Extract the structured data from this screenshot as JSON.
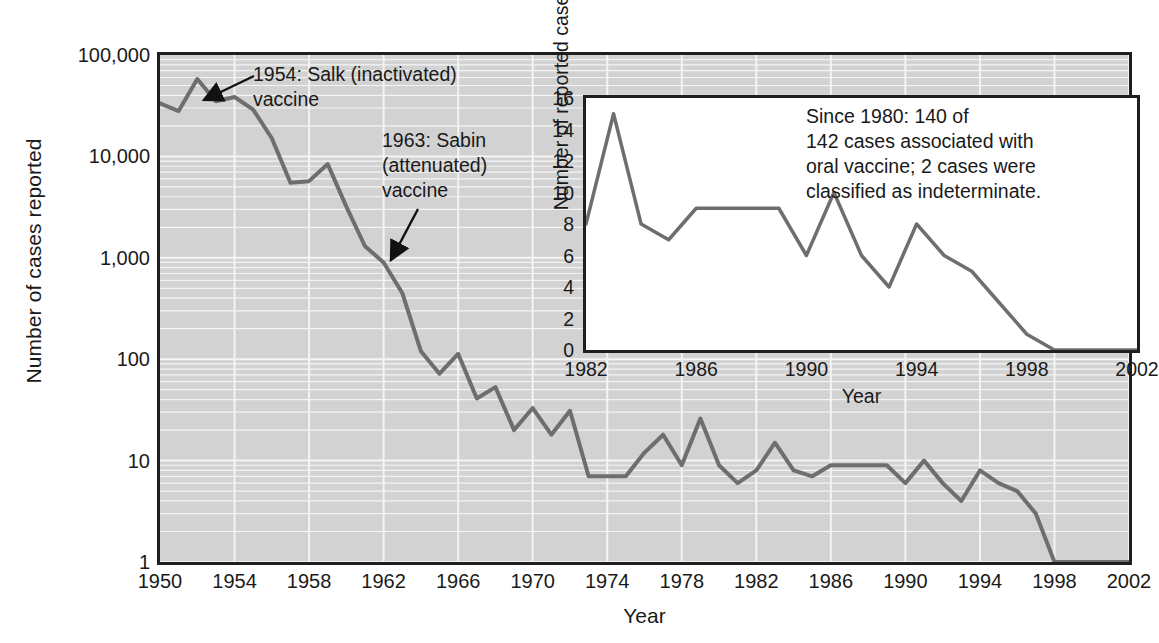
{
  "chart_data": [
    {
      "type": "line",
      "name": "main-chart",
      "title": "",
      "xlabel": "Year",
      "ylabel": "Number of cases reported",
      "yscale": "log",
      "ylim": [
        1,
        100000
      ],
      "xlim": [
        1950,
        2002
      ],
      "ytick_labels": [
        "1",
        "10",
        "100",
        "1,000",
        "10,000",
        "100,000"
      ],
      "ytick_values": [
        1,
        10,
        100,
        1000,
        10000,
        100000
      ],
      "xtick_labels": [
        "1950",
        "1954",
        "1958",
        "1962",
        "1966",
        "1970",
        "1974",
        "1978",
        "1982",
        "1986",
        "1990",
        "1994",
        "1998",
        "2002"
      ],
      "xtick_values": [
        1950,
        1954,
        1958,
        1962,
        1966,
        1970,
        1974,
        1978,
        1982,
        1986,
        1990,
        1994,
        1998,
        2002
      ],
      "grid": true,
      "legend": "none",
      "line_color": "#6e6e6e",
      "plot_background": "#d2d2d2",
      "x": [
        1950,
        1951,
        1952,
        1953,
        1954,
        1955,
        1956,
        1957,
        1958,
        1959,
        1960,
        1961,
        1962,
        1963,
        1964,
        1965,
        1966,
        1967,
        1968,
        1969,
        1970,
        1971,
        1972,
        1973,
        1974,
        1975,
        1976,
        1977,
        1978,
        1979,
        1980,
        1981,
        1982,
        1983,
        1984,
        1985,
        1986,
        1987,
        1988,
        1989,
        1990,
        1991,
        1992,
        1993,
        1994,
        1995,
        1996,
        1997,
        1998,
        1999,
        2000,
        2001,
        2002
      ],
      "y": [
        33300,
        28000,
        58000,
        35000,
        38500,
        28900,
        15100,
        5500,
        5700,
        8400,
        3200,
        1300,
        900,
        450,
        120,
        72,
        113,
        41,
        53,
        20,
        33,
        18,
        31,
        7,
        7,
        7,
        12,
        18,
        9,
        26,
        9,
        6,
        8,
        15,
        8,
        7,
        9,
        9,
        9,
        9,
        6,
        10,
        6,
        4,
        8,
        6,
        5,
        3,
        1,
        1,
        1,
        1,
        1
      ],
      "annotations": [
        {
          "name": "salk-annotation",
          "text": "1954: Salk (inactivated)\nvaccine",
          "points_to_year": 1955
        },
        {
          "name": "sabin-annotation",
          "text": "1963: Sabin\n(attenuated)\nvaccine",
          "points_to_year": 1963
        }
      ]
    },
    {
      "type": "line",
      "name": "inset-chart",
      "title": "",
      "xlabel": "Year",
      "ylabel": "Number of reported cases",
      "yscale": "linear",
      "ylim": [
        0,
        16
      ],
      "xlim": [
        1982,
        2002
      ],
      "ytick_labels": [
        "0",
        "2",
        "4",
        "6",
        "8",
        "10",
        "12",
        "14",
        "16"
      ],
      "ytick_values": [
        0,
        2,
        4,
        6,
        8,
        10,
        12,
        14,
        16
      ],
      "xtick_labels": [
        "1982",
        "1986",
        "1990",
        "1994",
        "1998",
        "2002"
      ],
      "xtick_values": [
        1982,
        1986,
        1990,
        1994,
        1998,
        2002
      ],
      "grid": false,
      "legend": "none",
      "line_color": "#6e6e6e",
      "plot_background": "#ffffff",
      "x": [
        1982,
        1983,
        1984,
        1985,
        1986,
        1987,
        1988,
        1989,
        1990,
        1991,
        1992,
        1993,
        1994,
        1995,
        1996,
        1997,
        1998,
        1999,
        2000,
        2001,
        2002
      ],
      "y": [
        8,
        15,
        8,
        7,
        9,
        9,
        9,
        9,
        6,
        10,
        6,
        4,
        8,
        6,
        5,
        3,
        1,
        0,
        0,
        0,
        0
      ],
      "annotations": [
        {
          "name": "inset-note",
          "text": "Since 1980: 140 of\n142 cases associated with\noral vaccine; 2 cases were\nclassified as indeterminate."
        }
      ]
    }
  ],
  "main": {
    "ylabel": "Number of cases reported",
    "xlabel": "Year",
    "annotation_salk": "1954: Salk (inactivated)\nvaccine",
    "annotation_sabin": "1963: Sabin\n(attenuated)\nvaccine"
  },
  "inset": {
    "ylabel": "Number of reported cases",
    "xlabel": "Year",
    "note": "Since 1980: 140 of\n142 cases associated with\noral vaccine; 2 cases were\nclassified as indeterminate."
  },
  "colors": {
    "line": "#6e6e6e",
    "main_background": "#d2d2d2",
    "inset_background": "#ffffff",
    "axis": "#1f1f1f",
    "gridline": "#f2f2f2",
    "text": "#1a1a1a"
  }
}
